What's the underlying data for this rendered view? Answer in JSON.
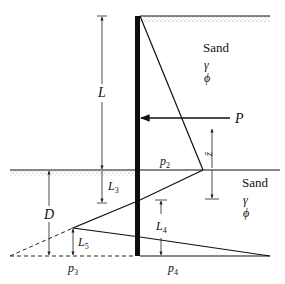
{
  "diagram": {
    "type": "cantilever sheet pile wall in sand - earth pressure distribution",
    "layers": [
      {
        "name": "upper_soil",
        "label": "Sand",
        "params": [
          "γ",
          "ϕ"
        ]
      },
      {
        "name": "lower_soil",
        "label": "Sand",
        "params": [
          "γ",
          "ϕ"
        ]
      }
    ],
    "dimensions": {
      "L": "L",
      "L3": "L",
      "L3_sub": "3",
      "L4": "L",
      "L4_sub": "4",
      "L5": "L",
      "L5_sub": "5",
      "D": "D",
      "zbar": "z̄"
    },
    "pressures": {
      "p2": "p",
      "p2_sub": "2",
      "p3": "p",
      "p3_sub": "3",
      "p4": "p",
      "p4_sub": "4"
    },
    "force": {
      "P": "P"
    },
    "colors": {
      "line": "#111111",
      "wall": "#0d0d0d",
      "dimension": "#333333",
      "stipple": "#9a9a9a"
    }
  }
}
